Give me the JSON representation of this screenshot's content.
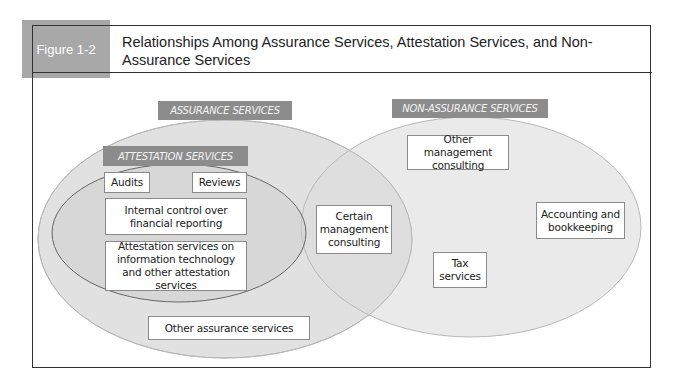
{
  "figure": {
    "label": "Figure 1-2",
    "title": "Relationships Among Assurance Services, Attestation Services, and Non-Assurance Services"
  },
  "colors": {
    "tab_gray": "#a8a8a8",
    "category_gray": "#8c8c8c",
    "ellipse_fill": "#dcdcdc",
    "frame": "#333333"
  },
  "diagram": {
    "assurance": {
      "label": "ASSURANCE SERVICES",
      "attestation": {
        "label": "ATTESTATION SERVICES",
        "items": [
          "Audits",
          "Reviews",
          "Internal control over financial reporting",
          "Attestation services on information technology and other attestation services"
        ]
      },
      "other": "Other assurance services"
    },
    "overlap": {
      "item": "Certain management consulting"
    },
    "non_assurance": {
      "label": "NON-ASSURANCE SERVICES",
      "items": [
        "Other management consulting",
        "Accounting and bookkeeping",
        "Tax services"
      ]
    }
  }
}
